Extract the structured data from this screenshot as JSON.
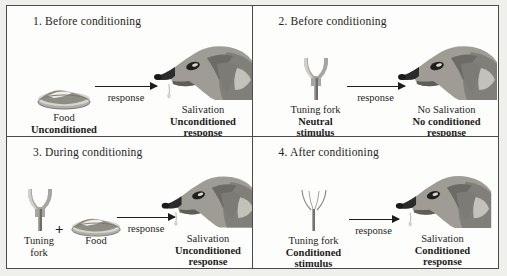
{
  "figure": {
    "panels": [
      {
        "id": "panel-1",
        "number": "1.",
        "title": "1. Before conditioning",
        "stimulus": {
          "icons": [
            "food-bowl-icon"
          ],
          "labels": [
            {
              "text": "Food",
              "weight": "plain"
            },
            {
              "text": "Unconditioned",
              "weight": "bold"
            },
            {
              "text": "stimulus",
              "weight": "bold"
            }
          ]
        },
        "arrow": {
          "label": "response",
          "icon": "right-arrow-icon"
        },
        "response": {
          "icon": "dog-head-salivating-icon",
          "salivating": true,
          "labels": [
            {
              "text": "Salivation",
              "weight": "plain"
            },
            {
              "text": "Unconditioned",
              "weight": "bold"
            },
            {
              "text": "response",
              "weight": "bold"
            }
          ]
        }
      },
      {
        "id": "panel-2",
        "number": "2.",
        "title": "2. Before conditioning",
        "stimulus": {
          "icons": [
            "tuning-fork-icon"
          ],
          "labels": [
            {
              "text": "Tuning fork",
              "weight": "plain"
            },
            {
              "text": "Neutral",
              "weight": "bold"
            },
            {
              "text": "stimulus",
              "weight": "bold"
            }
          ]
        },
        "arrow": {
          "label": "response",
          "icon": "right-arrow-icon"
        },
        "response": {
          "icon": "dog-head-icon",
          "salivating": false,
          "labels": [
            {
              "text": "No Salivation",
              "weight": "plain"
            },
            {
              "text": "No conditioned",
              "weight": "bold"
            },
            {
              "text": "response",
              "weight": "bold"
            }
          ]
        }
      },
      {
        "id": "panel-3",
        "number": "3.",
        "title": "3. During conditioning",
        "stimulus": {
          "icons": [
            "tuning-fork-icon",
            "plus-sign-icon",
            "food-bowl-icon"
          ],
          "plus": "+",
          "labels": [
            {
              "text": "Tuning",
              "weight": "plain"
            },
            {
              "text": "fork",
              "weight": "plain"
            },
            {
              "text": "Food",
              "weight": "plain"
            }
          ]
        },
        "arrow": {
          "label": "response",
          "icon": "right-arrow-icon"
        },
        "response": {
          "icon": "dog-head-salivating-icon",
          "salivating": true,
          "labels": [
            {
              "text": "Salivation",
              "weight": "plain"
            },
            {
              "text": "Unconditioned",
              "weight": "bold"
            },
            {
              "text": "response",
              "weight": "bold"
            }
          ]
        }
      },
      {
        "id": "panel-4",
        "number": "4.",
        "title": "4. After conditioning",
        "stimulus": {
          "icons": [
            "tuning-fork-icon"
          ],
          "labels": [
            {
              "text": "Tuning fork",
              "weight": "plain"
            },
            {
              "text": "Conditioned",
              "weight": "bold"
            },
            {
              "text": "stimulus",
              "weight": "bold"
            }
          ]
        },
        "arrow": {
          "label": "response",
          "icon": "right-arrow-icon"
        },
        "response": {
          "icon": "dog-head-salivating-icon",
          "salivating": true,
          "labels": [
            {
              "text": "Salivation",
              "weight": "plain"
            },
            {
              "text": "Conditioned",
              "weight": "bold"
            },
            {
              "text": "response",
              "weight": "bold"
            }
          ]
        }
      }
    ]
  },
  "colors": {
    "background": "#efefec",
    "panel_background": "#fdfdfb",
    "border": "#4a4a4a",
    "text": "#1d1d1d",
    "dog_light": "#b9b7b0",
    "dog_mid": "#8f8d86",
    "dog_dark": "#6d6b65",
    "dog_muzzle": "#2b2b2b",
    "fork_gray": "#9a9a95",
    "bowl_gray": "#b0aea8"
  }
}
